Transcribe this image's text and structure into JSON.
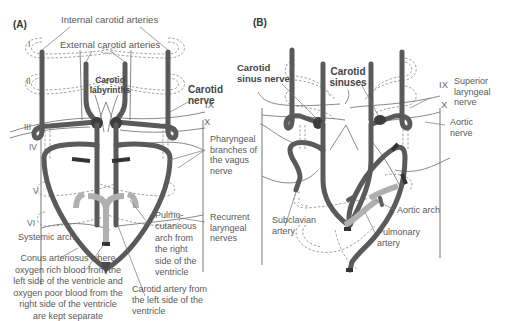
{
  "panels": [
    {
      "id": "A",
      "tag": "(A)",
      "labels": {
        "internal_carotid": "Internal carotid arteries",
        "external_carotid": "External carotid arteries",
        "carotid_labyrinths": "Carotid labyrinths",
        "carotid_nerve": "Carotid nerve",
        "pharyngeal": "Pharyngeal branches of the vagus nerve",
        "recurrent": "Recurrent laryngeal nerves",
        "systemic_arch": "Systemic arch",
        "pulmocutaneous": "Pulmo- cutaneous arch from the right side of the ventricle",
        "conus": "Conus arteriosus where oxygen rich blood from the left side of the ventricle and oxygen poor blood from the right side of the ventricle are kept separate",
        "carotid_artery": "Carotid artery from the left side of the ventricle"
      },
      "arch_numerals": [
        "I",
        "II",
        "III",
        "IV",
        "V",
        "VI"
      ],
      "nerve_numerals": [
        "IX",
        "X"
      ]
    },
    {
      "id": "B",
      "tag": "(B)",
      "labels": {
        "carotid_sinus_nerve": "Carotid sinus nerve",
        "carotid_sinuses": "Carotid sinuses",
        "superior_laryngeal": "Superior laryngeal nerve",
        "aortic_nerve": "Aortic nerve",
        "subclavian": "Subclavian artery",
        "aortic_arch": "Aortic arch",
        "pulmonary": "Pulmonary artery"
      },
      "nerve_numerals": [
        "IX",
        "X"
      ]
    }
  ],
  "colors": {
    "artery": "#5a5a5a",
    "artery_light": "#b5b5b5",
    "nerve": "#777777",
    "dashed": "#888888",
    "text": "#595959"
  }
}
